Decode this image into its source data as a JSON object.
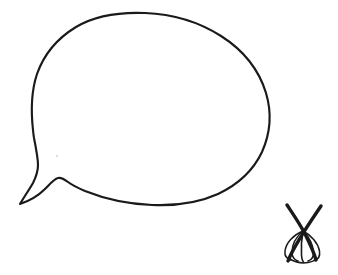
{
  "document": {
    "title": "Hand-drawn line sketch",
    "width": 338,
    "height": 275,
    "background_color": "#ffffff",
    "ink_color": "#1a1a1a",
    "style": "black ink contour line drawing on white paper, no text labels"
  },
  "objects": [
    {
      "id": "speech-bubble",
      "name": "speech-bubble-outline",
      "description": "Large rounded egg-shaped speech balloon with a pointed tail extending to the lower left",
      "stroke_color": "#1a1a1a",
      "stroke_width": 2.1,
      "fill": "none",
      "bounds": {
        "x": 19,
        "y": 13,
        "width": 251,
        "height": 192
      },
      "tail_tip": {
        "x": 20,
        "y": 204
      }
    },
    {
      "id": "insect-doodle",
      "name": "insect-doodle",
      "description": "Small dark doodle resembling an insect or whisk: two crossed straight strokes forming an X above a fan of five curved wing lines",
      "stroke_color": "#1a1a1a",
      "stroke_width": 2.4,
      "fill": "none",
      "bounds": {
        "x": 284,
        "y": 204,
        "width": 38,
        "height": 58
      },
      "cross_point": {
        "x": 303,
        "y": 230
      }
    },
    {
      "id": "paper-speck",
      "name": "paper-speck",
      "description": "Faint grey speck of paper noise inside the balloon",
      "color": "#cfcfcf",
      "position": {
        "x": 57,
        "y": 156
      }
    }
  ],
  "legend": {
    "has_text": false,
    "text_items": []
  }
}
